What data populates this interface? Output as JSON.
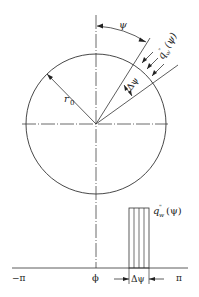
{
  "diagram": {
    "type": "geometric-schematic",
    "labels": {
      "angle": "ψ",
      "flux_top": "q̃w\"(ψ)",
      "flux_top_main": "q",
      "flux_top_sub": "w",
      "flux_top_sup": "\"",
      "flux_top_arg": "(ψ)",
      "delta_angle": "Δψ",
      "radius": "r",
      "radius_sub": "0",
      "axis_min": "−π",
      "axis_origin": "ϕ",
      "axis_max": "π",
      "delta_bottom": "Δψ",
      "flux_bottom_main": "q",
      "flux_bottom_sub": "w",
      "flux_bottom_sup": "\"",
      "flux_bottom_arg": "(ψ)"
    },
    "colors": {
      "line": "#333333",
      "background": "#ffffff"
    }
  }
}
